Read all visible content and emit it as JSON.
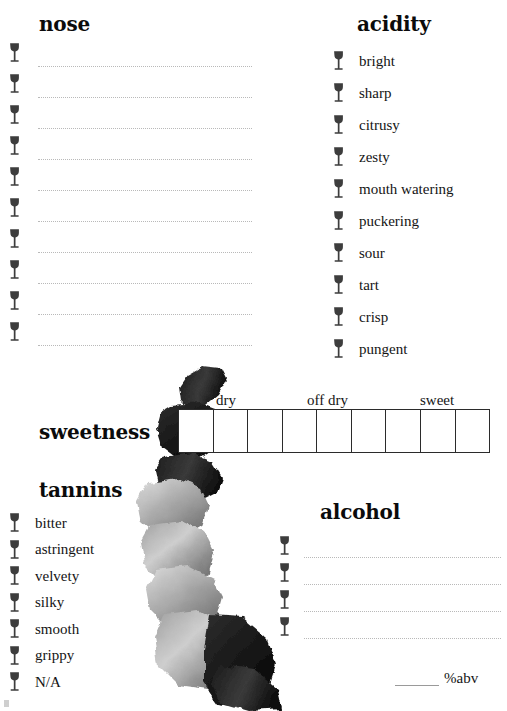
{
  "page": {
    "width": 507,
    "height": 711,
    "background": "#ffffff",
    "ink_color": "#141414"
  },
  "icons": {
    "wine_glass": "wine-glass-icon"
  },
  "nose": {
    "heading": "nose",
    "line_count": 10,
    "lines": [
      "",
      "",
      "",
      "",
      "",
      "",
      "",
      "",
      "",
      ""
    ]
  },
  "acidity": {
    "heading": "acidity",
    "options": [
      "bright",
      "sharp",
      "citrusy",
      "zesty",
      "mouth watering",
      "puckering",
      "sour",
      "tart",
      "crisp",
      "pungent"
    ]
  },
  "sweetness": {
    "heading": "sweetness",
    "cell_count": 9,
    "selected_index": null,
    "tick_labels": [
      "dry",
      "off dry",
      "sweet"
    ]
  },
  "tannins": {
    "heading": "tannins",
    "options": [
      "bitter",
      "astringent",
      "velvety",
      "silky",
      "smooth",
      "grippy",
      "N/A"
    ]
  },
  "alcohol": {
    "heading": "alcohol",
    "line_count": 4,
    "lines": [
      "",
      "",
      "",
      ""
    ],
    "abv_value": "",
    "abv_label": "%abv"
  }
}
